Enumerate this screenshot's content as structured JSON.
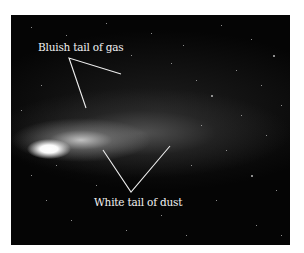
{
  "figure": {
    "annotations": [
      {
        "label": "Bluish tail of gas"
      },
      {
        "label": "White tail of dust"
      }
    ]
  }
}
